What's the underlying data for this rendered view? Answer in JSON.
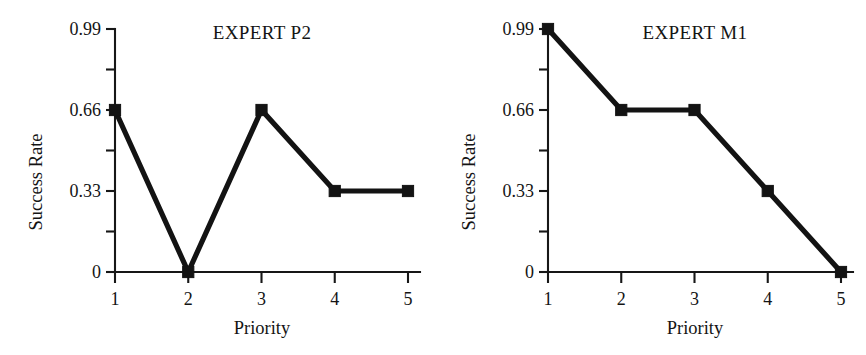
{
  "figure": {
    "background_color": "#ffffff",
    "ink_color": "#131313",
    "panel_count": 2
  },
  "chart_data": [
    {
      "type": "line",
      "panel": "left",
      "title": "EXPERT P2",
      "xlabel": "Priority",
      "ylabel": "Success Rate",
      "categories": [
        "1",
        "2",
        "3",
        "4",
        "5"
      ],
      "x": [
        1,
        2,
        3,
        4,
        5
      ],
      "values": [
        0.66,
        0,
        0.66,
        0.33,
        0.33
      ],
      "xlim": [
        1,
        5
      ],
      "ylim": [
        0,
        0.99
      ],
      "ytick_labels": [
        "0",
        "0.33",
        "0.66",
        "0.99"
      ],
      "ytick_values": [
        0,
        0.33,
        0.66,
        0.99
      ],
      "yminor_values": [
        0.165,
        0.495,
        0.825
      ],
      "xtick_labels": [
        "1",
        "2",
        "3",
        "4",
        "5"
      ],
      "grid": false,
      "legend": false,
      "marker": "filled-square",
      "line_color": "#131313"
    },
    {
      "type": "line",
      "panel": "right",
      "title": "EXPERT M1",
      "xlabel": "Priority",
      "ylabel": "Success Rate",
      "categories": [
        "1",
        "2",
        "3",
        "4",
        "5"
      ],
      "x": [
        1,
        2,
        3,
        4,
        5
      ],
      "values": [
        0.99,
        0.66,
        0.66,
        0.33,
        0
      ],
      "xlim": [
        1,
        5
      ],
      "ylim": [
        0,
        0.99
      ],
      "ytick_labels": [
        "0",
        "0.33",
        "0.66",
        "0.99"
      ],
      "ytick_values": [
        0,
        0.33,
        0.66,
        0.99
      ],
      "yminor_values": [
        0.165,
        0.495,
        0.825
      ],
      "xtick_labels": [
        "1",
        "2",
        "3",
        "4",
        "5"
      ],
      "grid": false,
      "legend": false,
      "marker": "filled-square",
      "line_color": "#131313"
    }
  ]
}
